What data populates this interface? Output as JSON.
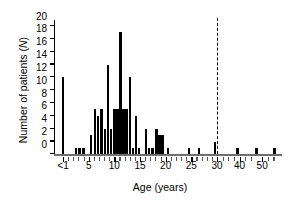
{
  "chart_data": {
    "type": "bar",
    "title": "",
    "xlabel": "Age (years)",
    "ylabel": "Number of patients (N)",
    "ylabel_plain": "Number of patients",
    "ylabel_italic_part": "N",
    "ylim": [
      0,
      20
    ],
    "yticks": [
      0,
      2,
      4,
      6,
      8,
      10,
      12,
      14,
      16,
      18,
      20
    ],
    "ytick_labels": [
      "0",
      "2",
      "4",
      "6",
      "8",
      "10",
      "12",
      "14",
      "16",
      "18",
      "20"
    ],
    "xtick_labels": [
      "<1",
      "5",
      "10",
      "15",
      "20",
      "25",
      "30",
      "40",
      "50"
    ],
    "xtick_values": [
      0,
      5,
      10,
      15,
      20,
      25,
      30,
      40,
      50
    ],
    "xlim": [
      -1,
      57
    ],
    "x_axis_note": "scale compressed beyond 30",
    "grid": false,
    "legend": false,
    "annotations": [
      {
        "type": "vertical-dashed-line",
        "x": 30,
        "label": "30 years"
      }
    ],
    "bar_color": "#000000",
    "categories": [
      0,
      2.5,
      3.2,
      4.0,
      5.5,
      6.2,
      6.8,
      7.5,
      8.2,
      8.8,
      9.4,
      10.0,
      10.6,
      11.2,
      11.8,
      12.4,
      13.0,
      13.6,
      14.2,
      14.8,
      16.2,
      16.8,
      17.4,
      18.2,
      18.8,
      19.4,
      20.5,
      24.5,
      26.5,
      29.6,
      39.0,
      47.5,
      55.5
    ],
    "values": [
      12,
      1,
      1,
      1,
      3,
      7,
      6,
      7,
      4,
      14,
      4,
      7,
      7,
      19,
      7,
      7,
      12,
      1,
      6,
      1,
      4,
      1,
      1,
      4,
      3,
      3,
      1,
      1,
      1,
      2,
      1,
      1,
      1
    ]
  }
}
